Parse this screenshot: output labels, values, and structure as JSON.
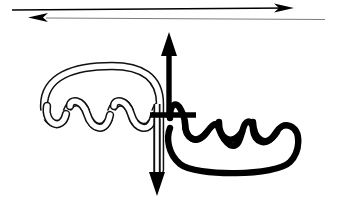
{
  "figure": {
    "type": "knot-diagram",
    "width": 337,
    "height": 208,
    "background_color": "#ffffff"
  },
  "colors": {
    "solid_strand": "#000000",
    "hollow_strand_outline": "#1a1a1a",
    "hollow_strand_fill": "#ffffff",
    "thin_axis_line": "#8a8a8a",
    "background": "#ffffff"
  },
  "top_arrows": {
    "upper": {
      "label": "upper reference line, arrow pointing right",
      "direction": "right",
      "x1": 12,
      "y1": 10,
      "x2": 291,
      "y2": 8,
      "stroke_width": 1.6,
      "color": "#000000",
      "arrowhead_x": 291,
      "arrowhead_y": 8
    },
    "lower": {
      "label": "lower reference line, arrow pointing left",
      "direction": "left",
      "x1": 325,
      "y1": 18,
      "x2": 33,
      "y2": 18,
      "stroke_width": 1.2,
      "color": "#7d7d7d",
      "arrowhead_x": 33,
      "arrowhead_y": 18
    }
  },
  "axes": {
    "solid_horizontal": {
      "label": "thick black horizontal strand",
      "x1": 12,
      "x2": 200,
      "y": 115,
      "stroke_width": 5.5,
      "color": "#000000"
    },
    "hollow_horizontal": {
      "label": "thin outlined horizontal strand",
      "x1": 135,
      "x2": 326,
      "y": 124,
      "stroke_width": 3.2,
      "color": "#8a8a8a"
    }
  },
  "vertical_arrows": {
    "up": {
      "label": "vertical solid strand with upward arrow",
      "x": 168,
      "y_top": 44,
      "y_bottom": 118,
      "stroke_width": 5,
      "color": "#000000",
      "direction": "up"
    },
    "down": {
      "label": "vertical hollow strand with downward arrow",
      "x": 155,
      "y_top": 118,
      "y_bottom": 182,
      "stroke_width": 4,
      "color": "#000000",
      "direction": "down"
    }
  },
  "left_strand": {
    "name": "hollow-coil-strand",
    "style": "outlined white tube",
    "coil_count": 3,
    "arch_left_x": 42,
    "arch_right_x": 160,
    "arch_top_y": 67,
    "wraps_around": "solid_horizontal",
    "tube_width": 7
  },
  "right_strand": {
    "name": "solid-coil-strand",
    "style": "filled black tube",
    "coil_count": 3,
    "loop_left_x": 172,
    "loop_right_x": 292,
    "loop_bottom_y": 170,
    "wraps_around": "hollow_horizontal",
    "tube_width": 6
  },
  "crossing": {
    "label": "central crossing point of the two strands",
    "x": 168,
    "y": 118
  }
}
